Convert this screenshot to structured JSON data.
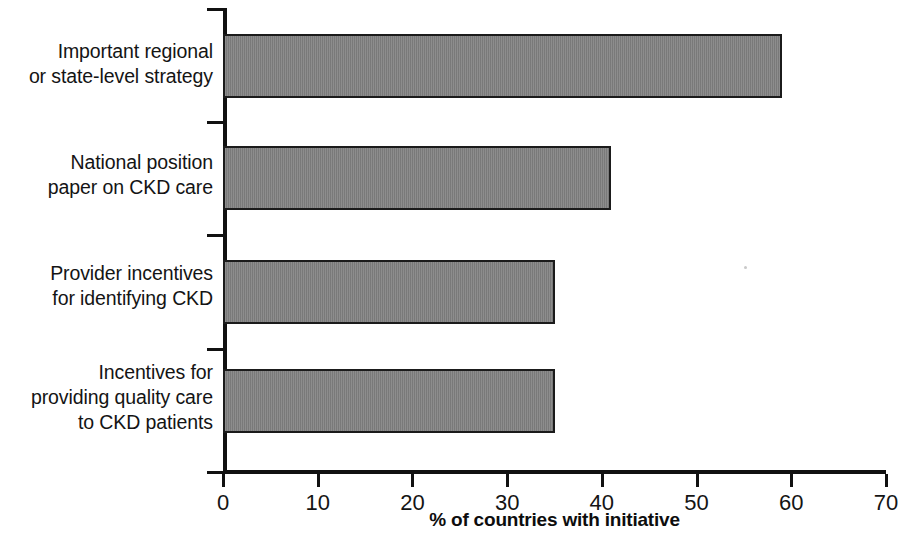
{
  "chart_data": {
    "type": "bar",
    "orientation": "horizontal",
    "title": "",
    "categories": [
      "Important regional\nor state-level strategy",
      "National position\npaper on CKD care",
      "Provider incentives\nfor identifying CKD",
      "Incentives for\nproviding quality care\nto CKD patients"
    ],
    "values": [
      59,
      41,
      35,
      35
    ],
    "xlabel": "% of countries with initiative",
    "ylabel": "",
    "xlim": [
      0,
      70
    ],
    "xticks": [
      0,
      10,
      20,
      30,
      40,
      50,
      60,
      70
    ],
    "xtick_labels": [
      "0",
      "10",
      "20",
      "30",
      "40",
      "50",
      "60",
      "70"
    ],
    "grid": false,
    "legend": false,
    "bar_color": "#808080",
    "bar_edge_color": "#1b1b1b",
    "axis_color": "#111111",
    "background": "#ffffff"
  },
  "axis": {
    "x_title": "% of countries with initiative"
  }
}
